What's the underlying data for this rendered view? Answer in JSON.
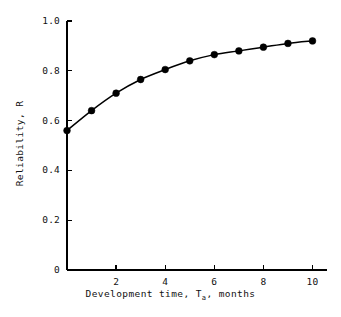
{
  "chart_data": {
    "type": "line",
    "title": "",
    "subtitle": "",
    "xlabel_prefix": "Development time, T",
    "xlabel_sub": "a",
    "xlabel_suffix": ", months",
    "xlabel_full": "Development time, T_a, months",
    "ylabel": "Reliability, R",
    "x": [
      0,
      1,
      2,
      3,
      4,
      5,
      6,
      7,
      8,
      9,
      10
    ],
    "values": [
      0.56,
      0.64,
      0.71,
      0.765,
      0.805,
      0.84,
      0.865,
      0.88,
      0.895,
      0.91,
      0.92
    ],
    "series": [
      {
        "name": "Reliability",
        "values": [
          0.56,
          0.64,
          0.71,
          0.765,
          0.805,
          0.84,
          0.865,
          0.88,
          0.895,
          0.91,
          0.92
        ]
      }
    ],
    "xlim": [
      0,
      10.6
    ],
    "ylim": [
      0,
      1.0
    ],
    "xticks": [
      2,
      4,
      6,
      8,
      10
    ],
    "xtick_labels": [
      "2",
      "4",
      "6",
      "8",
      "10"
    ],
    "yticks": [
      0,
      0.2,
      0.4,
      0.6,
      0.8,
      1.0
    ],
    "ytick_labels": [
      "0",
      "0.2",
      "0.4",
      "0.6",
      "0.8",
      "1.0"
    ],
    "grid": false,
    "legend": false,
    "legend_position": "none",
    "marker": "filled-circle",
    "marker_color": "#000000",
    "line_color": "#000000",
    "background_color": "#ffffff",
    "annotations": []
  }
}
